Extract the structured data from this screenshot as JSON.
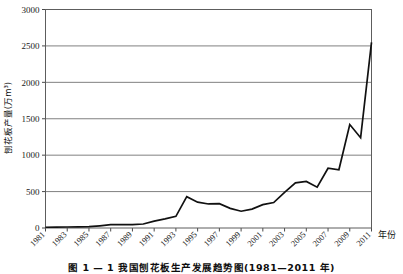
{
  "figure": {
    "caption": "图 1 — 1   我国刨花板生产发展趋势图(1981—2011 年)"
  },
  "chart_data": {
    "type": "line",
    "title": "",
    "xlabel": "年份",
    "ylabel": "刨花板产量(万m³)",
    "ylim": [
      0,
      3000
    ],
    "ytick_values": [
      0,
      500,
      1000,
      1500,
      2000,
      2500,
      3000
    ],
    "ytick_labels": [
      "0",
      "500",
      "1000",
      "1500",
      "2000",
      "2500",
      "3000"
    ],
    "grid": true,
    "grid_axis": "y",
    "legend": "none",
    "line_color": "#111111",
    "grid_color": "#808080",
    "x": [
      1981,
      1982,
      1983,
      1984,
      1985,
      1986,
      1987,
      1988,
      1989,
      1990,
      1991,
      1992,
      1993,
      1994,
      1995,
      1996,
      1997,
      1998,
      1999,
      2000,
      2001,
      2002,
      2003,
      2004,
      2005,
      2006,
      2007,
      2008,
      2009,
      2010,
      2011
    ],
    "xtick_labels": [
      "1981",
      "1983",
      "1985",
      "1987",
      "1989",
      "1991",
      "1993",
      "1995",
      "1997",
      "1999",
      "2001",
      "2003",
      "2005",
      "2007",
      "2009",
      "2011"
    ],
    "values": [
      10,
      12,
      14,
      16,
      18,
      30,
      45,
      48,
      45,
      55,
      95,
      125,
      160,
      430,
      355,
      330,
      335,
      270,
      230,
      260,
      320,
      350,
      490,
      620,
      640,
      560,
      820,
      800,
      1420,
      1240,
      2550
    ],
    "series": [
      {
        "name": "刨花板产量",
        "values": [
          10,
          12,
          14,
          16,
          18,
          30,
          45,
          48,
          45,
          55,
          95,
          125,
          160,
          430,
          355,
          330,
          335,
          270,
          230,
          260,
          320,
          350,
          490,
          620,
          640,
          560,
          820,
          800,
          1420,
          1240,
          2550
        ]
      }
    ]
  }
}
